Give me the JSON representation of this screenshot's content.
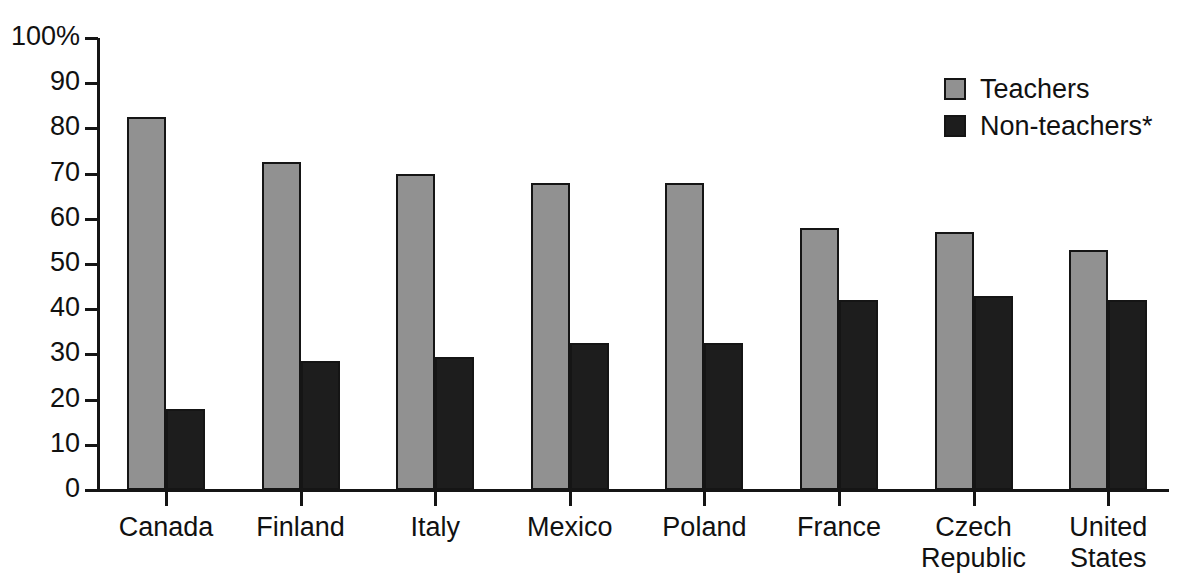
{
  "chart_data": {
    "type": "bar",
    "title": "",
    "subtitle": "",
    "xlabel": "",
    "ylabel": "",
    "ylim": [
      0,
      100
    ],
    "grid": false,
    "legend_position": "top-right",
    "categories": [
      "Canada",
      "Finland",
      "Italy",
      "Mexico",
      "Poland",
      "France",
      "Czech\nRepublic",
      "United\nStates"
    ],
    "y_ticks": [
      "0",
      "10",
      "20",
      "30",
      "40",
      "50",
      "60",
      "70",
      "80",
      "90",
      "100%"
    ],
    "y_tick_values": [
      0,
      10,
      20,
      30,
      40,
      50,
      60,
      70,
      80,
      90,
      100
    ],
    "series": [
      {
        "name": "Teachers",
        "color": "#919191",
        "values": [
          82.5,
          72.5,
          70,
          68,
          68,
          58,
          57,
          53
        ]
      },
      {
        "name": "Non-teachers*",
        "color": "#1d1d1d",
        "values": [
          18,
          28.5,
          29.5,
          32.5,
          32.5,
          42,
          43,
          42
        ]
      }
    ],
    "annotations": []
  },
  "legend": {
    "items": [
      {
        "label": "Teachers",
        "swatch": "teachers-swatch"
      },
      {
        "label": "Non-teachers*",
        "swatch": "nonteachers-swatch"
      }
    ]
  },
  "colors": {
    "teachers": "#919191",
    "nonteachers": "#1d1d1d",
    "axis": "#151515",
    "text": "#111111",
    "background": "#ffffff"
  }
}
